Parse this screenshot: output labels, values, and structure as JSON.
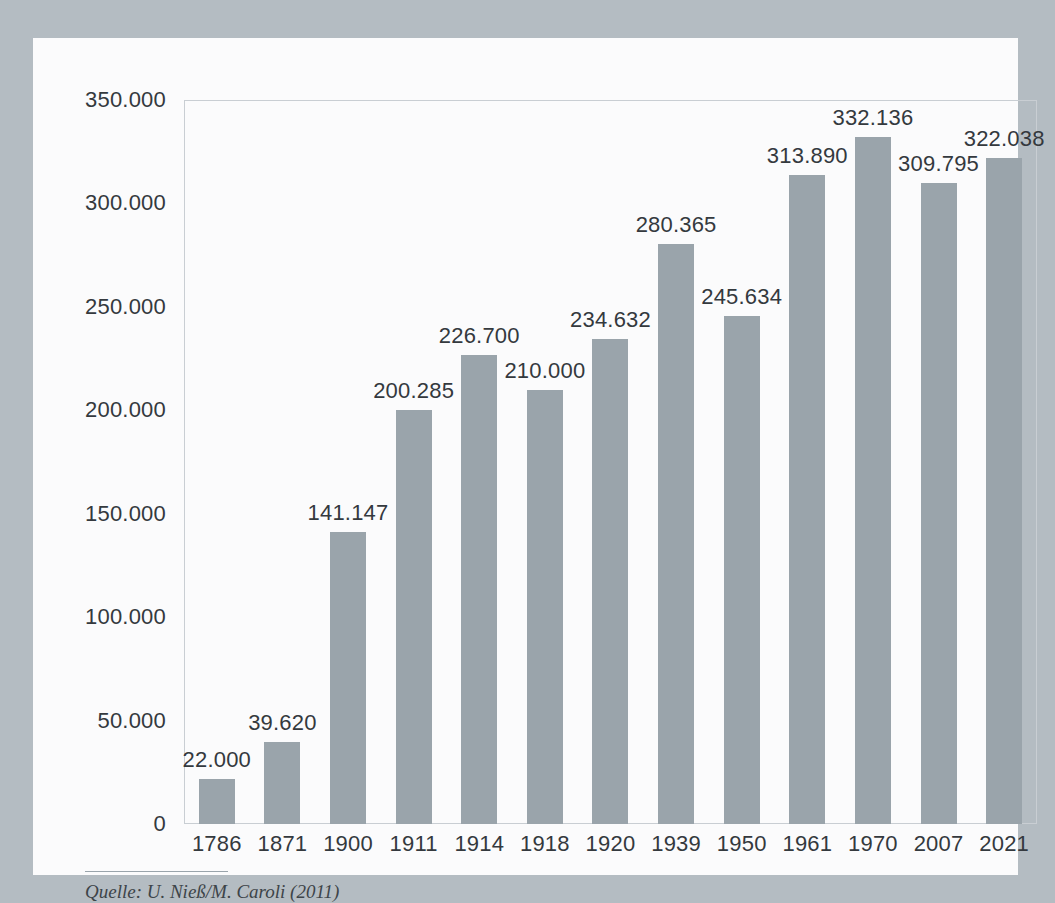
{
  "chart_data": {
    "type": "bar",
    "title": "",
    "subtitle": "",
    "xlabel": "",
    "ylabel": "",
    "categories": [
      "1786",
      "1871",
      "1900",
      "1911",
      "1914",
      "1918",
      "1920",
      "1939",
      "1950",
      "1961",
      "1970",
      "2007",
      "2021"
    ],
    "values": [
      22000,
      39620,
      141147,
      200285,
      226700,
      210000,
      234632,
      280365,
      245634,
      313890,
      332136,
      309795,
      322038
    ],
    "value_labels": [
      "22.000",
      "39.620",
      "141.147",
      "200.285",
      "226.700",
      "210.000",
      "234.632",
      "280.365",
      "245.634",
      "313.890",
      "332.136",
      "309.795",
      "322.038"
    ],
    "ylim": [
      0,
      350000
    ],
    "y_ticks": [
      0,
      50000,
      100000,
      150000,
      200000,
      250000,
      300000,
      350000
    ],
    "y_tick_labels": [
      "0",
      "50.000",
      "100.000",
      "150.000",
      "200.000",
      "250.000",
      "300.000",
      "350.000"
    ],
    "grid": false,
    "legend": null,
    "bar_color": "#9aa4ab",
    "text_color": "#34393e",
    "plot_border_color": "#c9ced3",
    "card_color": "#fbfbfc",
    "background_color": "#b4bcc2",
    "number_format": "german-thousands-dot"
  },
  "source": {
    "text": "Quelle: U. Nieß/M. Caroli (2011)"
  }
}
